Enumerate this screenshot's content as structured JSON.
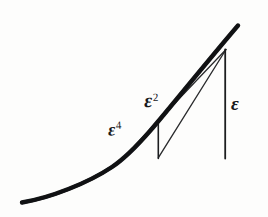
{
  "figure": {
    "kind": "hand-drawn-mathematical-sketch",
    "background_color": "#fdfdfc",
    "ink_color": "#17181a",
    "caption": "",
    "labels": [
      {
        "id": "eps4",
        "name": "epsilon-fourth-label",
        "base": "ε",
        "exponent": "4",
        "x": 108,
        "y": 120
      },
      {
        "id": "eps2",
        "name": "epsilon-squared-label",
        "base": "ε",
        "exponent": "2",
        "x": 144,
        "y": 90
      },
      {
        "id": "eps1",
        "name": "epsilon-label",
        "base": "ε",
        "exponent": "",
        "x": 231,
        "y": 94
      }
    ],
    "elements": {
      "baseline": {
        "name": "horizontal-axis-line",
        "x1": 20,
        "y1": 158,
        "x2": 252,
        "y2": 158,
        "stroke_width": 1.6
      },
      "curve": {
        "name": "thick-curve",
        "stroke_width": 4.4,
        "description": "rising convex curve crossing the baseline",
        "path": "M 22 202 C 56 196 96 178 122 159 C 150 138 196 83 238 26"
      },
      "vertical_short": {
        "name": "epsilon-squared-vertical",
        "x": 158,
        "y_top": 120,
        "y_bottom": 158,
        "stroke_width": 1.5
      },
      "vertical_tall": {
        "name": "epsilon-vertical",
        "x": 225,
        "y_top": 50,
        "y_bottom": 158,
        "stroke_width": 1.7
      },
      "chord_long": {
        "name": "long-chord-line",
        "x1": 158,
        "y1": 158,
        "x2": 226,
        "y2": 49,
        "stroke_width": 1.3
      },
      "chord_short": {
        "name": "short-chord-line",
        "x1": 123,
        "y1": 159,
        "x2": 158,
        "y2": 120,
        "stroke_width": 1.3
      },
      "chord_upper": {
        "name": "secant-chord-line",
        "x1": 158,
        "y1": 120,
        "x2": 226,
        "y2": 49,
        "stroke_width": 1.3
      }
    }
  }
}
